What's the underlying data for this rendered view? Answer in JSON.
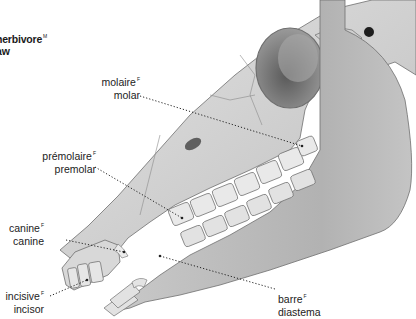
{
  "title": {
    "line1": "herbivore",
    "line1_gender": "M",
    "line2": "aw"
  },
  "labels": [
    {
      "id": "molar",
      "fr": "molaire",
      "gender": "F",
      "en": "molar"
    },
    {
      "id": "premolar",
      "fr": "prémolaire",
      "gender": "F",
      "en": "premolar"
    },
    {
      "id": "canine",
      "fr": "canine",
      "gender": "F",
      "en": "canine"
    },
    {
      "id": "incisor",
      "fr": "incisive",
      "gender": "F",
      "en": "incisor"
    },
    {
      "id": "diastema",
      "fr": "barre",
      "gender": "F",
      "en": "diastema"
    }
  ],
  "colors": {
    "bone_light": "#d6d6d6",
    "bone_mid": "#b9b9b9",
    "bone_dark": "#8a8a8a",
    "outline": "#6e6e6e",
    "text": "#1a1a1a"
  }
}
